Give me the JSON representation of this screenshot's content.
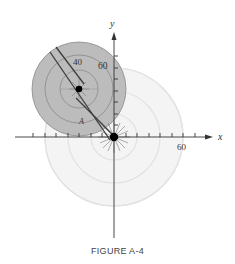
{
  "figure": {
    "caption": "FIGURE A-4",
    "axes": {
      "x_label": "x",
      "y_label": "y",
      "x_tick_label": "60",
      "y_tick_label": "60"
    },
    "annotations": {
      "ring_label": "40",
      "point_label": "A"
    },
    "colors": {
      "shaded_disk": "#bdbdbd",
      "shaded_ring_lines": "#8a8a8a",
      "faint_rings": "#e4e4e4",
      "axis": "#333333",
      "strip": "#444444"
    }
  }
}
